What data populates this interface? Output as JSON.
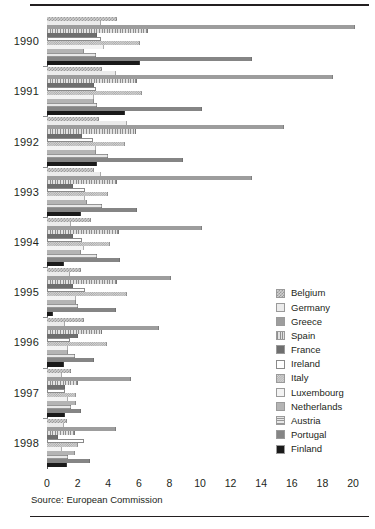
{
  "source_note": "Source: European Commission",
  "chart_data": {
    "type": "bar",
    "orientation": "horizontal",
    "title": "",
    "subtitle": "",
    "xlabel": "",
    "ylabel": "",
    "xlim": [
      0,
      20
    ],
    "xticks": [
      0,
      2,
      4,
      6,
      8,
      10,
      12,
      14,
      16,
      18,
      20
    ],
    "xtick_labels": [
      "0",
      "2",
      "4",
      "6",
      "8",
      "10",
      "12",
      "14",
      "16",
      "18",
      "20"
    ],
    "grid": false,
    "legend_position": "right",
    "categories": [
      "1990",
      "1991",
      "1992",
      "1993",
      "1994",
      "1995",
      "1996",
      "1997",
      "1998"
    ],
    "series": [
      {
        "name": "Belgium",
        "color": "#cfcfcf",
        "pattern": "fine-checker",
        "values": [
          4.6,
          3.6,
          3.4,
          3.1,
          2.9,
          2.2,
          2.4,
          1.6,
          1.3
        ]
      },
      {
        "name": "Germany",
        "color": "#ebebeb",
        "pattern": "solid-very-light",
        "values": [
          3.5,
          4.5,
          5.2,
          3.5,
          1.6,
          1.5,
          1.2,
          1.0,
          1.1
        ]
      },
      {
        "name": "Greece",
        "color": "#9d9d9d",
        "pattern": "solid-medium",
        "values": [
          20.1,
          18.7,
          15.5,
          13.4,
          10.1,
          8.1,
          7.3,
          5.5,
          4.5
        ]
      },
      {
        "name": "Spain",
        "color": "#d8d8d8",
        "pattern": "vertical-stripes",
        "values": [
          6.6,
          5.9,
          5.8,
          4.6,
          4.7,
          4.6,
          3.6,
          2.0,
          1.8
        ]
      },
      {
        "name": "France",
        "color": "#6e6e6e",
        "pattern": "solid-dark",
        "values": [
          3.3,
          3.1,
          2.3,
          1.7,
          1.7,
          1.7,
          2.0,
          1.2,
          0.7
        ]
      },
      {
        "name": "Ireland",
        "color": "#ffffff",
        "pattern": "white-outline",
        "values": [
          3.5,
          3.2,
          3.0,
          2.5,
          2.3,
          2.5,
          1.5,
          1.2,
          2.4
        ]
      },
      {
        "name": "Italy",
        "color": "#d4d4d4",
        "pattern": "coarse-checker",
        "values": [
          6.1,
          6.2,
          5.1,
          4.0,
          4.1,
          5.2,
          3.9,
          1.9,
          2.0
        ]
      },
      {
        "name": "Luxembourg",
        "color": "#f3f3f3",
        "pattern": "solid-lightest",
        "values": [
          3.7,
          3.1,
          3.2,
          2.5,
          2.4,
          1.9,
          1.4,
          1.4,
          1.0
        ]
      },
      {
        "name": "Netherlands",
        "color": "#b4b4b4",
        "pattern": "solid-light-medium",
        "values": [
          2.4,
          3.1,
          3.2,
          2.6,
          2.2,
          1.9,
          1.4,
          1.9,
          1.8
        ]
      },
      {
        "name": "Austria",
        "color": "#dcdcdc",
        "pattern": "horizontal-stripes",
        "values": [
          3.2,
          3.3,
          4.0,
          3.6,
          3.3,
          2.0,
          1.8,
          1.6,
          1.4
        ]
      },
      {
        "name": "Portugal",
        "color": "#858585",
        "pattern": "solid-mid-dark",
        "values": [
          13.4,
          10.1,
          8.9,
          5.9,
          4.8,
          4.5,
          3.1,
          2.2,
          2.8
        ]
      },
      {
        "name": "Finland",
        "color": "#1a1a1a",
        "pattern": "solid-black",
        "values": [
          6.1,
          5.1,
          3.3,
          2.2,
          1.1,
          0.4,
          1.1,
          1.2,
          1.3
        ]
      }
    ]
  }
}
